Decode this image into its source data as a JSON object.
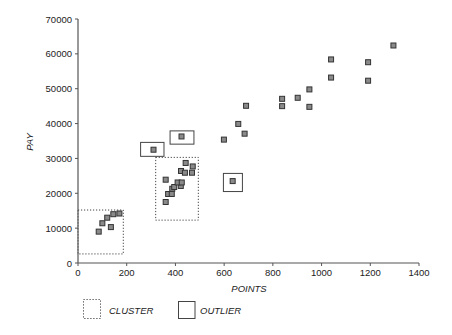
{
  "chart_data": {
    "type": "scatter",
    "title": "",
    "xlabel": "POINTS",
    "ylabel": "PAY",
    "xlim": [
      0,
      1400
    ],
    "ylim": [
      0,
      70000
    ],
    "xticks": [
      0,
      200,
      400,
      600,
      800,
      1000,
      1200,
      1400
    ],
    "yticks": [
      0,
      10000,
      20000,
      30000,
      40000,
      50000,
      60000,
      70000
    ],
    "grid": false,
    "marker": "square",
    "series": [
      {
        "name": "players",
        "points": [
          [
            85,
            9000
          ],
          [
            100,
            11400
          ],
          [
            120,
            13000
          ],
          [
            135,
            10300
          ],
          [
            145,
            14000
          ],
          [
            170,
            14200
          ],
          [
            310,
            32500
          ],
          [
            425,
            36300
          ],
          [
            635,
            23500
          ],
          [
            360,
            17500
          ],
          [
            370,
            19800
          ],
          [
            385,
            19800
          ],
          [
            387,
            21300
          ],
          [
            395,
            21800
          ],
          [
            422,
            22100
          ],
          [
            409,
            23100
          ],
          [
            426,
            23100
          ],
          [
            360,
            23900
          ],
          [
            423,
            26400
          ],
          [
            439,
            25900
          ],
          [
            468,
            25900
          ],
          [
            442,
            28700
          ],
          [
            471,
            27700
          ],
          [
            599,
            35400
          ],
          [
            684,
            37100
          ],
          [
            658,
            39900
          ],
          [
            690,
            45100
          ],
          [
            838,
            47100
          ],
          [
            838,
            45000
          ],
          [
            902,
            47400
          ],
          [
            950,
            49800
          ],
          [
            950,
            44800
          ],
          [
            1039,
            58400
          ],
          [
            1039,
            53200
          ],
          [
            1191,
            57600
          ],
          [
            1191,
            52300
          ],
          [
            1295,
            62400
          ]
        ]
      }
    ],
    "annotations": {
      "clusters": [
        {
          "x0": 0,
          "x1": 186,
          "y0": 2600,
          "y1": 15200
        },
        {
          "x0": 319,
          "x1": 494,
          "y0": 12300,
          "y1": 30300
        }
      ],
      "outliers": [
        {
          "x0": 257,
          "x1": 353,
          "y0": 30600,
          "y1": 34600
        },
        {
          "x0": 378,
          "x1": 476,
          "y0": 34100,
          "y1": 37900
        },
        {
          "x0": 597,
          "x1": 675,
          "y0": 20500,
          "y1": 25700
        }
      ]
    },
    "legend": {
      "position": "bottom-left",
      "entries": [
        {
          "label": "CLUSTER",
          "style": "dotted-box"
        },
        {
          "label": "OUTLIER",
          "style": "solid-box"
        }
      ]
    }
  },
  "colors": {
    "axis": "#555555",
    "marker_fill": "#8a8a8a",
    "marker_stroke": "#333333",
    "box_stroke": "#444444"
  }
}
